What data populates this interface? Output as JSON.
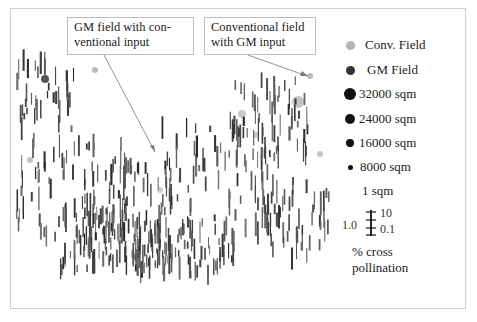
{
  "figure": {
    "callouts": [
      {
        "line1": "GM field with con-",
        "line2": "ventional input"
      },
      {
        "line1": "Conventional field",
        "line2": "with GM input"
      }
    ],
    "legend": {
      "items": [
        {
          "label": "Conv. Field",
          "color": "#b5b5b5",
          "size": 9
        },
        {
          "label": "GM Field",
          "color": "#333333",
          "size": 9
        },
        {
          "label": "32000 sqm",
          "color": "#111111",
          "size": 12
        },
        {
          "label": "24000 sqm",
          "color": "#111111",
          "size": 10
        },
        {
          "label": "16000 sqm",
          "color": "#111111",
          "size": 8
        },
        {
          "label": "8000 sqm",
          "color": "#111111",
          "size": 5
        },
        {
          "label": "1 sqm",
          "color": "#111111",
          "size": 0
        }
      ],
      "scale": {
        "left_label": "1.0",
        "top_label": "10",
        "bottom_label": "0.1"
      },
      "caption_line1": "% cross",
      "caption_line2": "pollination"
    },
    "colors": {
      "conv_field": "#b5b5b5",
      "gm_field": "#333333",
      "bars": "#3a3a3a",
      "frame": "#cfcfcf"
    }
  }
}
